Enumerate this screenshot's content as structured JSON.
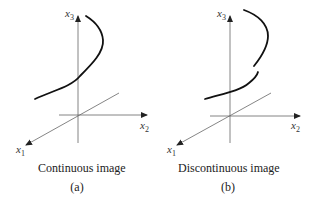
{
  "figure": {
    "panels": [
      {
        "id": "a",
        "caption": "Continuous image",
        "label": "(a)",
        "axes": {
          "x1": "x",
          "x1_sub": "1",
          "x2": "x",
          "x2_sub": "2",
          "x3": "x",
          "x3_sub": "3"
        },
        "curve_type": "continuous"
      },
      {
        "id": "b",
        "caption": "Discontinuous image",
        "label": "(b)",
        "axes": {
          "x1": "x",
          "x1_sub": "1",
          "x2": "x",
          "x2_sub": "2",
          "x3": "x",
          "x3_sub": "3"
        },
        "curve_type": "discontinuous"
      }
    ],
    "colors": {
      "axis": "#555555",
      "curve": "#111111",
      "text": "#222222"
    }
  }
}
